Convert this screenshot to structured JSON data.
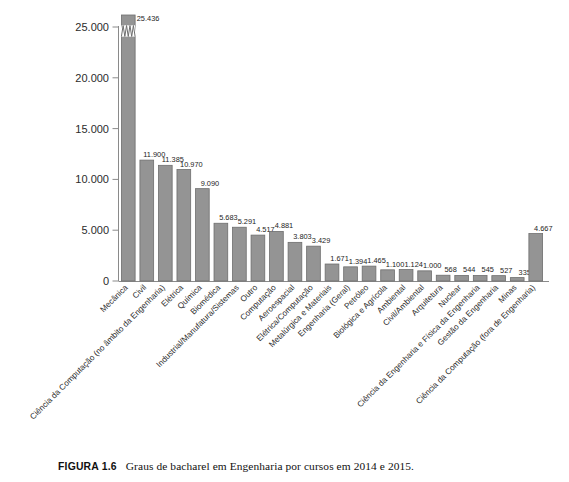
{
  "figure": {
    "label": "FIGURA 1.6",
    "caption": "Graus de bacharel em Engenharia por cursos em 2014 e 2015."
  },
  "colors": {
    "bar_fill": "#949494",
    "bar_stroke": "#6e6e6e",
    "axis": "#8a8a8a",
    "text": "#242424",
    "background": "#ffffff"
  },
  "chart_data": {
    "type": "bar",
    "title": "",
    "subtitle": "",
    "xlabel": "",
    "ylabel": "",
    "ylim": [
      0,
      26500
    ],
    "grid": false,
    "legend": null,
    "axis_break": {
      "present": true,
      "series_index": 0,
      "note": "Primeira barra truncada com marca de quebra de eixo"
    },
    "ytick_labels": [
      "0",
      "5.000",
      "10.000",
      "15.000",
      "20.000",
      "25.000"
    ],
    "ytick_values": [
      0,
      5000,
      10000,
      15000,
      20000,
      25000
    ],
    "categories": [
      "Mecânica",
      "Civil",
      "Ciência da Computação (no âmbito da Engenharia)",
      "Elétrica",
      "Química",
      "Biomédica",
      "Industrial/Manufatura/Sistemas",
      "Outro",
      "Computação",
      "Aeroespacial",
      "Elétrica/Computação",
      "Metalúrgica e Materiais",
      "Engenharia (Geral)",
      "Petróleo",
      "Biológica e Agrícola",
      "Ambiental",
      "Civil/Ambiental",
      "Arquitetura",
      "Nuclear",
      "Ciência da Engenharia e Física da Engenharia",
      "Gestão da Engenharia",
      "Minas",
      "Ciência da Computação (fora de Engenharia)"
    ],
    "values": [
      25436,
      11900,
      11385,
      10970,
      9090,
      5683,
      5291,
      4517,
      4881,
      3803,
      3429,
      1671,
      1394,
      1465,
      1100,
      1124,
      1000,
      568,
      544,
      545,
      527,
      335,
      4667
    ],
    "value_labels": [
      "25.436",
      "11.900",
      "11.385",
      "10.970",
      "9.090",
      "5.683",
      "5.291",
      "4.517",
      "4.881",
      "3.803",
      "3.429",
      "1.671",
      "1.394",
      "1.465",
      "1.100",
      "1.124",
      "1.000",
      "568",
      "544",
      "545",
      "527",
      "335",
      "4.667"
    ]
  }
}
